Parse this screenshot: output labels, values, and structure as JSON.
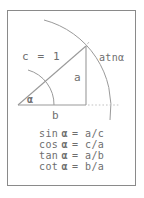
{
  "figure": {
    "border_color": "#8a8a8a",
    "line_color": "#9a9a9a",
    "text_color": "#6e6e6e",
    "background": "#ffffff",
    "box": {
      "x": 7,
      "y": 10,
      "width": 129,
      "height": 176
    }
  },
  "diagram": {
    "labels": {
      "hypotenuse": "c = 1",
      "opposite": "a",
      "adjacent": "b",
      "angle": "α",
      "arc_label": "atnα"
    },
    "geometry": {
      "vertex_origin": {
        "x": 18,
        "y": 105
      },
      "vertex_right_angle": {
        "x": 86,
        "y": 105
      },
      "vertex_apex": {
        "x": 86,
        "y": 46
      },
      "angle_degrees": 41,
      "unit_radius": 90,
      "arc_outer_start": {
        "x": 44,
        "y": 20
      },
      "arc_outer_end": {
        "x": 110,
        "y": 120
      },
      "angle_arc_radius": 36,
      "dotted_line_from": {
        "x": 88,
        "y": 105
      },
      "dotted_line_to": {
        "x": 118,
        "y": 105
      }
    }
  },
  "formulas": {
    "items": [
      {
        "name": "sin",
        "function": "sin",
        "angle": "α",
        "equals": "=",
        "expression": "a/c",
        "full": "sin α = a/c"
      },
      {
        "name": "cos",
        "function": "cos",
        "angle": "α",
        "equals": "=",
        "expression": "c/a",
        "full": "cos α = c/a"
      },
      {
        "name": "tan",
        "function": "tan",
        "angle": "α",
        "equals": "=",
        "expression": "a/b",
        "full": "tan α = a/b"
      },
      {
        "name": "cot",
        "function": "cot",
        "angle": "α",
        "equals": "=",
        "expression": "b/a",
        "full": "cot α = b/a"
      }
    ]
  },
  "caption": {
    "text": ""
  }
}
